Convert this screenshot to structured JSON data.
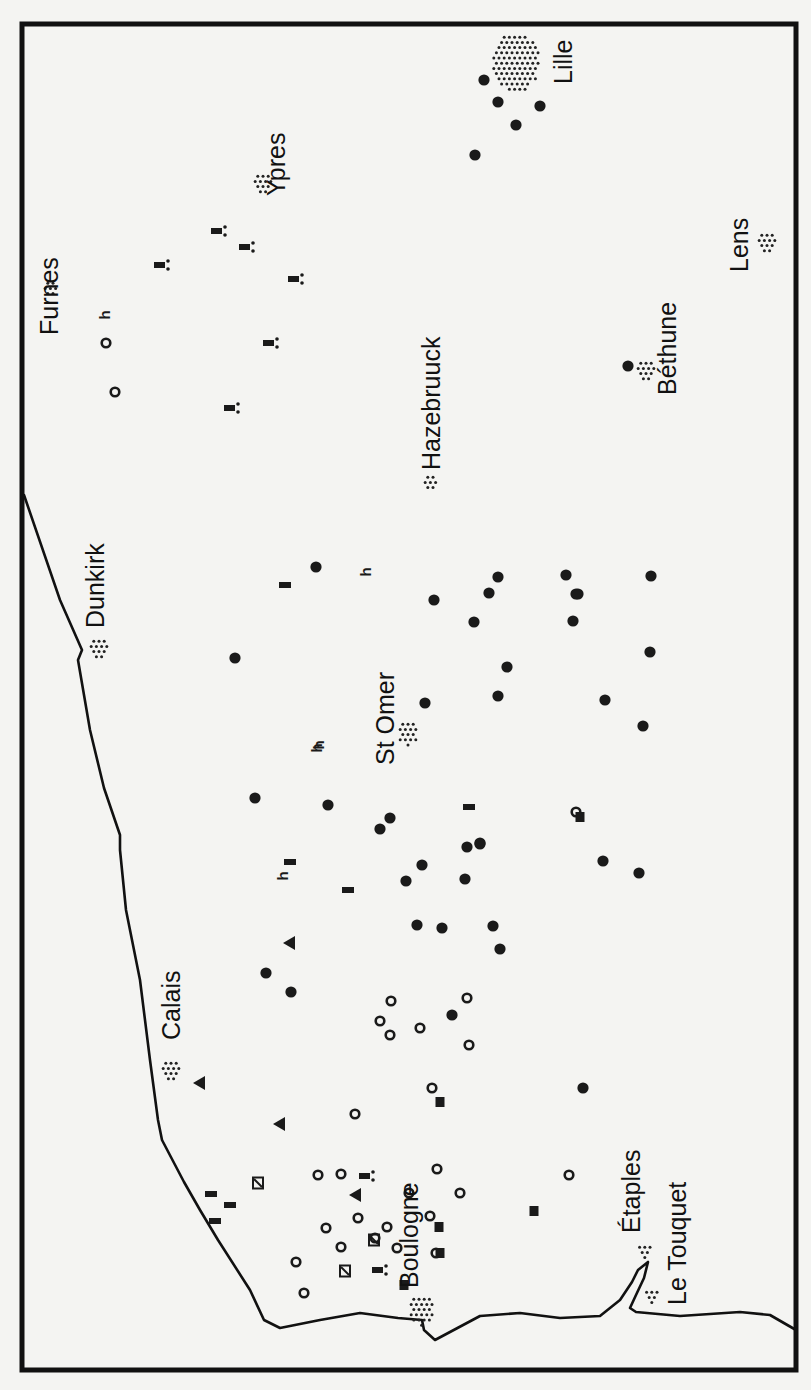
{
  "map": {
    "background": "#f4f4f2",
    "ink": "#111111",
    "frame": {
      "x": 22,
      "y": 24,
      "w": 774,
      "h": 1346
    },
    "coastline": "M 24 495 L 60 600 L 82 650 L 78 660 L 90 730 L 104 788 L 120 835 L 120 850 L 126 910 L 140 980 L 150 1060 L 158 1120 L 162 1140 L 184 1182 L 200 1210 L 218 1240 L 250 1290 L 264 1320 L 280 1328 L 320 1320 L 360 1313 L 398 1318 L 422 1320 L 424 1330 L 435 1340 L 450 1332 L 480 1316 L 520 1313 L 560 1318 L 600 1316 L 620 1300 L 632 1282 L 638 1270 L 648 1262 L 644 1278 L 636 1295 L 630 1308 L 636 1312 L 680 1316 L 740 1312 L 770 1315 L 796 1330",
    "towns": [
      {
        "name": "Lille",
        "x": 516,
        "y": 62,
        "r": 30,
        "label_x": 572,
        "label_y": 84
      },
      {
        "name": "Ypres",
        "x": 262,
        "y": 183,
        "r": 12,
        "label_x": 285,
        "label_y": 196
      },
      {
        "name": "Lens",
        "x": 766,
        "y": 242,
        "r": 12,
        "label_x": 748,
        "label_y": 272
      },
      {
        "name": "Furnes",
        "x": 50,
        "y": 288,
        "r": 10,
        "label_x": 58,
        "label_y": 335
      },
      {
        "name": "Béthune",
        "x": 645,
        "y": 370,
        "r": 12,
        "label_x": 676,
        "label_y": 395
      },
      {
        "name": "Hazebruuck",
        "x": 430,
        "y": 482,
        "r": 10,
        "label_x": 440,
        "label_y": 470
      },
      {
        "name": "Dunkirk",
        "x": 98,
        "y": 648,
        "r": 12,
        "label_x": 104,
        "label_y": 628
      },
      {
        "name": "St Omer",
        "x": 408,
        "y": 732,
        "r": 13,
        "label_x": 394,
        "label_y": 765
      },
      {
        "name": "Calais",
        "x": 170,
        "y": 1070,
        "r": 12,
        "label_x": 180,
        "label_y": 1040
      },
      {
        "name": "Boulogne",
        "x": 422,
        "y": 1310,
        "r": 16,
        "label_x": 418,
        "label_y": 1288
      },
      {
        "name": "Étaples",
        "x": 645,
        "y": 1250,
        "r": 8,
        "label_x": 640,
        "label_y": 1233
      },
      {
        "name": "Le Touquet",
        "x": 652,
        "y": 1295,
        "r": 8,
        "label_x": 686,
        "label_y": 1305
      }
    ],
    "symbols": {
      "filled_dot": [
        [
          484,
          80
        ],
        [
          498,
          102
        ],
        [
          540,
          106
        ],
        [
          516,
          125
        ],
        [
          475,
          155
        ],
        [
          628,
          366
        ],
        [
          316,
          567
        ],
        [
          498,
          577
        ],
        [
          566,
          575
        ],
        [
          434,
          600
        ],
        [
          489,
          593
        ],
        [
          651,
          576
        ],
        [
          578,
          594
        ],
        [
          576,
          594
        ],
        [
          474,
          622
        ],
        [
          573,
          621
        ],
        [
          650,
          652
        ],
        [
          235,
          658
        ],
        [
          507,
          667
        ],
        [
          498,
          696
        ],
        [
          425,
          703
        ],
        [
          605,
          700
        ],
        [
          643,
          726
        ],
        [
          255,
          798
        ],
        [
          328,
          805
        ],
        [
          390,
          818
        ],
        [
          380,
          829
        ],
        [
          480,
          843
        ],
        [
          467,
          847
        ],
        [
          422,
          865
        ],
        [
          406,
          881
        ],
        [
          465,
          879
        ],
        [
          480,
          844
        ],
        [
          603,
          861
        ],
        [
          639,
          873
        ],
        [
          417,
          925
        ],
        [
          442,
          928
        ],
        [
          493,
          926
        ],
        [
          500,
          949
        ],
        [
          266,
          973
        ],
        [
          291,
          992
        ],
        [
          452,
          1015
        ],
        [
          583,
          1088
        ]
      ],
      "open_ring": [
        [
          106,
          343
        ],
        [
          115,
          392
        ],
        [
          391,
          1001
        ],
        [
          380,
          1021
        ],
        [
          390,
          1035
        ],
        [
          420,
          1028
        ],
        [
          467,
          998
        ],
        [
          469,
          1045
        ],
        [
          355,
          1114
        ],
        [
          432,
          1088
        ],
        [
          318,
          1175
        ],
        [
          341,
          1174
        ],
        [
          326,
          1228
        ],
        [
          358,
          1218
        ],
        [
          409,
          1193
        ],
        [
          437,
          1169
        ],
        [
          569,
          1175
        ],
        [
          460,
          1193
        ],
        [
          430,
          1216
        ],
        [
          387,
          1227
        ],
        [
          375,
          1238
        ],
        [
          397,
          1248
        ],
        [
          341,
          1247
        ],
        [
          436,
          1253
        ],
        [
          296,
          1262
        ],
        [
          304,
          1293
        ],
        [
          576,
          812
        ]
      ],
      "square": [
        [
          440,
          1102
        ],
        [
          580,
          817
        ],
        [
          439,
          1227
        ],
        [
          534,
          1211
        ],
        [
          404,
          1285
        ],
        [
          440,
          1253
        ]
      ],
      "hatched_square": [
        [
          258,
          1183
        ],
        [
          374,
          1240
        ],
        [
          345,
          1271
        ]
      ],
      "bar": [
        [
          285,
          585
        ],
        [
          348,
          890
        ],
        [
          290,
          862
        ],
        [
          469,
          807
        ],
        [
          230,
          1205
        ],
        [
          211,
          1194
        ],
        [
          215,
          1221
        ]
      ],
      "bar_colon": [
        [
          217,
          231
        ],
        [
          245,
          247
        ],
        [
          160,
          265
        ],
        [
          294,
          279
        ],
        [
          269,
          343
        ],
        [
          230,
          408
        ],
        [
          365,
          1176
        ],
        [
          378,
          1270
        ]
      ],
      "triangle": [
        [
          290,
          943
        ],
        [
          200,
          1083
        ],
        [
          280,
          1124
        ],
        [
          356,
          1195
        ]
      ],
      "h_glyph": [
        [
          106,
          315
        ],
        [
          367,
          572
        ],
        [
          318,
          748
        ],
        [
          284,
          876
        ],
        [
          320,
          745
        ]
      ]
    }
  }
}
